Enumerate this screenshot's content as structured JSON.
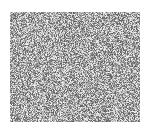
{
  "image": {
    "description": "grayscale noise texture",
    "background_color": "#ffffff",
    "texture": {
      "x": 10,
      "y": 12,
      "width": 130,
      "height": 110,
      "min_gray": 90,
      "max_gray": 245
    }
  }
}
